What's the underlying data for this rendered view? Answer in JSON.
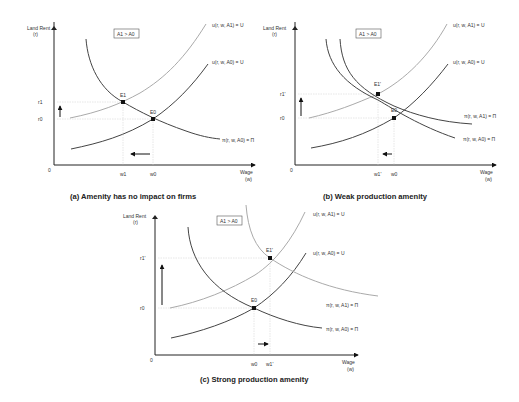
{
  "panels": [
    {
      "id": "a",
      "caption": "(a) Amenity has no impact on firms",
      "y_axis_label": "Land Rent",
      "y_axis_sub": "(r)",
      "x_axis_label": "Wage",
      "x_axis_sub": "(w)",
      "origin": "0",
      "box_label": "A1 > A0",
      "curves": [
        {
          "label": "u(r, w, A1) = U",
          "shade": "light"
        },
        {
          "label": "u(r, w, A0) = U",
          "shade": "dark"
        },
        {
          "label": "π(r, w, A0) = Π",
          "shade": "dark"
        }
      ],
      "points": [
        {
          "label": "E1"
        },
        {
          "label": "E0"
        }
      ],
      "y_ticks": [
        "r1",
        "r0"
      ],
      "x_ticks": [
        "w1",
        "w0"
      ],
      "arrows": [
        "up",
        "left"
      ]
    },
    {
      "id": "b",
      "caption": "(b) Weak production amenity",
      "y_axis_label": "Land Rent",
      "y_axis_sub": "(r)",
      "x_axis_label": "Wage",
      "x_axis_sub": "(w)",
      "origin": "0",
      "box_label": "A1 > A0",
      "curves": [
        {
          "label": "u(r, w, A1) = U",
          "shade": "light"
        },
        {
          "label": "u(r, w, A0) = U",
          "shade": "dark"
        },
        {
          "label": "π(r, w, A1) = Π",
          "shade": "dark"
        },
        {
          "label": "π(r, w, A0) = Π",
          "shade": "dark"
        }
      ],
      "points": [
        {
          "label": "E1'"
        },
        {
          "label": "E0"
        }
      ],
      "y_ticks": [
        "r1'",
        "r0"
      ],
      "x_ticks": [
        "w1'",
        "w0"
      ],
      "arrows": [
        "up",
        "left"
      ]
    },
    {
      "id": "c",
      "caption": "(c) Strong production amenity",
      "y_axis_label": "Land Rent",
      "y_axis_sub": "(r)",
      "x_axis_label": "Wage",
      "x_axis_sub": "(w)",
      "origin": "0",
      "box_label": "A1 > A0",
      "curves": [
        {
          "label": "u(r, w, A1) = U",
          "shade": "light"
        },
        {
          "label": "u(r, w, A0) = U",
          "shade": "dark"
        },
        {
          "label": "π(r, w, A1) = Π",
          "shade": "light"
        },
        {
          "label": "π(r, w, A0) = Π",
          "shade": "dark"
        }
      ],
      "points": [
        {
          "label": "E1'"
        },
        {
          "label": "E0"
        }
      ],
      "y_ticks": [
        "r1'",
        "r0"
      ],
      "x_ticks": [
        "w0",
        "w1'"
      ],
      "arrows": [
        "up",
        "right"
      ]
    }
  ],
  "colors": {
    "dark_curve": "#444444",
    "light_curve": "#aaaaaa",
    "axis": "#222222",
    "guide": "#cccccc"
  }
}
